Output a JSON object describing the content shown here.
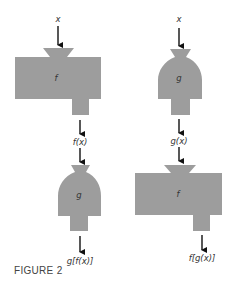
{
  "figure": {
    "caption": "FIGURE 2",
    "colors": {
      "shape_fill": "#9d9d9d",
      "arrow": "#111111",
      "text": "#333333"
    }
  },
  "left_column": {
    "input_label": "x",
    "first_machine": {
      "type": "rectangular",
      "label": "f"
    },
    "intermediate_label": "f(x)",
    "second_machine": {
      "type": "dome",
      "label": "g"
    },
    "output_label": "g[f(x)]"
  },
  "right_column": {
    "input_label": "x",
    "first_machine": {
      "type": "dome",
      "label": "g"
    },
    "intermediate_label": "g(x)",
    "second_machine": {
      "type": "rectangular",
      "label": "f"
    },
    "output_label": "f[g(x)]"
  }
}
